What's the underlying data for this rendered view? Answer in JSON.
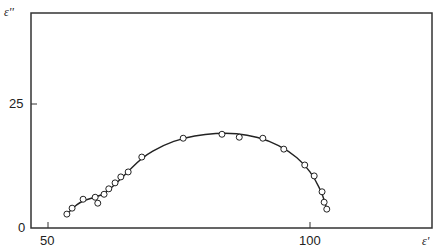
{
  "chart_data": {
    "type": "scatter",
    "title": "",
    "xlabel": "ε'",
    "ylabel": "ε''",
    "xlim": [
      46.6,
      123
    ],
    "ylim": [
      0,
      43.3
    ],
    "x_ticks": [
      50,
      100
    ],
    "y_ticks": [
      0,
      25
    ],
    "grid": false,
    "series": [
      {
        "name": "measured",
        "marker": "open-circle",
        "points": [
          [
            53.6,
            2.8
          ],
          [
            54.6,
            4.0
          ],
          [
            59.5,
            5.0
          ],
          [
            56.7,
            5.8
          ],
          [
            59.0,
            6.2
          ],
          [
            60.7,
            6.8
          ],
          [
            61.6,
            7.9
          ],
          [
            62.8,
            9.1
          ],
          [
            63.9,
            10.3
          ],
          [
            65.3,
            11.3
          ],
          [
            67.9,
            14.3
          ],
          [
            75.8,
            18.1
          ],
          [
            83.2,
            18.9
          ],
          [
            86.5,
            18.3
          ],
          [
            91.0,
            18.1
          ],
          [
            95.0,
            15.9
          ],
          [
            99.0,
            12.7
          ],
          [
            100.8,
            10.5
          ],
          [
            102.3,
            7.3
          ],
          [
            102.7,
            5.2
          ],
          [
            103.2,
            3.8
          ]
        ]
      },
      {
        "name": "fit",
        "type": "line",
        "points": [
          [
            53.6,
            2.8
          ],
          [
            56,
            5.3
          ],
          [
            59,
            6.2
          ],
          [
            61,
            7.0
          ],
          [
            64,
            10.0
          ],
          [
            68,
            14.3
          ],
          [
            72,
            16.7
          ],
          [
            76,
            18.2
          ],
          [
            80,
            18.9
          ],
          [
            84,
            19.2
          ],
          [
            88,
            18.8
          ],
          [
            92,
            17.7
          ],
          [
            96,
            15.5
          ],
          [
            99,
            12.8
          ],
          [
            101,
            9.8
          ],
          [
            102.5,
            6.5
          ],
          [
            103.2,
            3.8
          ]
        ]
      }
    ]
  },
  "axes": {
    "y_label": "ε''",
    "x_label": "ε'",
    "y_tick_0": "0",
    "y_tick_25": "25",
    "x_tick_50": "50",
    "x_tick_100": "100"
  }
}
